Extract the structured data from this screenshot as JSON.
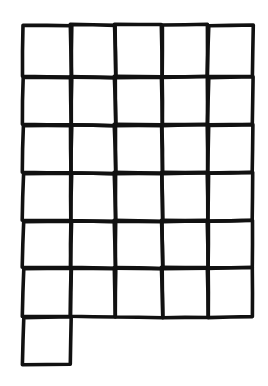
{
  "diagram": {
    "type": "hand-drawn-grid",
    "full_rows": 6,
    "columns": 5,
    "extra_cells": [
      {
        "row": 6,
        "col": 0
      }
    ],
    "total_cells": 31,
    "column_edges_x": [
      23,
      71,
      115,
      162,
      208,
      253
    ],
    "row_edges_y": [
      25,
      77,
      125,
      173,
      221,
      268,
      317,
      365
    ],
    "line_color": "#111111",
    "background_color": "#ffffff"
  }
}
